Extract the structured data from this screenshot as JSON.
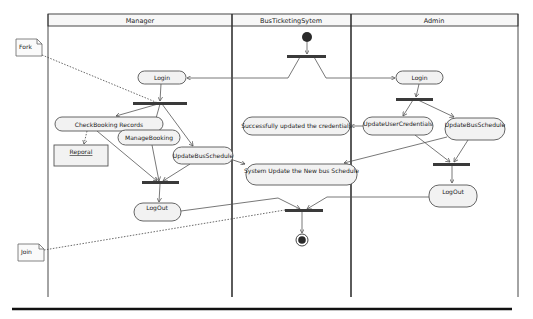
{
  "diagram": {
    "type": "UML activity diagram with swimlanes",
    "lanes": [
      {
        "id": "manager",
        "title": "Manager"
      },
      {
        "id": "system",
        "title": "BusTicketingSytem"
      },
      {
        "id": "admin",
        "title": "Admin"
      }
    ],
    "notes": [
      {
        "id": "fork-note",
        "text": "Fork",
        "attached_to": "manager-fork-bar"
      },
      {
        "id": "join-note",
        "text": "Join",
        "attached_to": "system-join-bar"
      }
    ],
    "nodes": {
      "system_initial": {
        "kind": "initial",
        "lane": "system"
      },
      "system_fork": {
        "kind": "fork",
        "lane": "system"
      },
      "manager_login": {
        "kind": "action",
        "lane": "manager",
        "label": "Login"
      },
      "manager_fork": {
        "kind": "fork",
        "lane": "manager"
      },
      "check_booking": {
        "kind": "action",
        "lane": "manager",
        "label": "CheckBooking Records"
      },
      "reporal": {
        "kind": "object",
        "lane": "manager",
        "label": "Reporal"
      },
      "manage_booking": {
        "kind": "action",
        "lane": "manager",
        "label": "ManageBooking"
      },
      "manager_update_bus": {
        "kind": "action",
        "lane": "manager",
        "label": "UpdateBusSchedule"
      },
      "manager_join": {
        "kind": "join",
        "lane": "manager"
      },
      "manager_logout": {
        "kind": "action",
        "lane": "manager",
        "label": "LogOut"
      },
      "success_credentials": {
        "kind": "action",
        "lane": "system",
        "label": "Successfully updated the credentials"
      },
      "system_update_schedule": {
        "kind": "action",
        "lane": "system",
        "label": "System Update the New bus Schedule"
      },
      "system_join": {
        "kind": "join",
        "lane": "system"
      },
      "system_final": {
        "kind": "final",
        "lane": "system"
      },
      "admin_login": {
        "kind": "action",
        "lane": "admin",
        "label": "Login"
      },
      "admin_fork": {
        "kind": "fork",
        "lane": "admin"
      },
      "update_user_credentials": {
        "kind": "action",
        "lane": "admin",
        "label": "UpdateUserCredentials"
      },
      "admin_update_bus": {
        "kind": "action",
        "lane": "admin",
        "label": "UpdateBusSchedule"
      },
      "admin_join": {
        "kind": "join",
        "lane": "admin"
      },
      "admin_logout": {
        "kind": "action",
        "lane": "admin",
        "label": "LogOut"
      }
    },
    "edges": [
      [
        "system_initial",
        "system_fork"
      ],
      [
        "system_fork",
        "manager_login"
      ],
      [
        "system_fork",
        "admin_login"
      ],
      [
        "manager_login",
        "manager_fork"
      ],
      [
        "manager_fork",
        "check_booking"
      ],
      [
        "manager_fork",
        "manage_booking"
      ],
      [
        "manager_fork",
        "manager_update_bus"
      ],
      [
        "check_booking",
        "reporal"
      ],
      [
        "check_booking",
        "manager_join"
      ],
      [
        "manage_booking",
        "manager_join"
      ],
      [
        "manager_update_bus",
        "manager_join"
      ],
      [
        "manager_update_bus",
        "system_update_schedule"
      ],
      [
        "manager_join",
        "manager_logout"
      ],
      [
        "admin_login",
        "admin_fork"
      ],
      [
        "admin_fork",
        "update_user_credentials"
      ],
      [
        "admin_fork",
        "admin_update_bus"
      ],
      [
        "update_user_credentials",
        "success_credentials"
      ],
      [
        "update_user_credentials",
        "admin_join"
      ],
      [
        "admin_update_bus",
        "admin_join"
      ],
      [
        "admin_update_bus",
        "system_update_schedule"
      ],
      [
        "admin_join",
        "admin_logout"
      ],
      [
        "manager_logout",
        "system_join"
      ],
      [
        "admin_logout",
        "system_join"
      ],
      [
        "system_join",
        "system_final"
      ]
    ]
  },
  "colors": {
    "line": "#555555",
    "bar": "#3a3a3a",
    "action_fill": "#f2f2f2",
    "background": "#ffffff"
  }
}
